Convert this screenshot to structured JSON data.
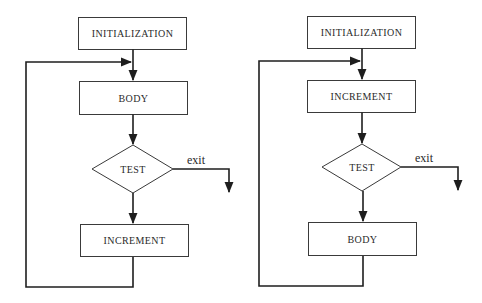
{
  "diagrams": [
    {
      "name": "loop-test-after-body",
      "nodes": {
        "init": "INITIALIZATION",
        "first": "BODY",
        "test": "TEST",
        "second": "INCREMENT"
      },
      "exit_label": "exit"
    },
    {
      "name": "loop-test-after-increment",
      "nodes": {
        "init": "INITIALIZATION",
        "first": "INCREMENT",
        "test": "TEST",
        "second": "BODY"
      },
      "exit_label": "exit"
    }
  ]
}
